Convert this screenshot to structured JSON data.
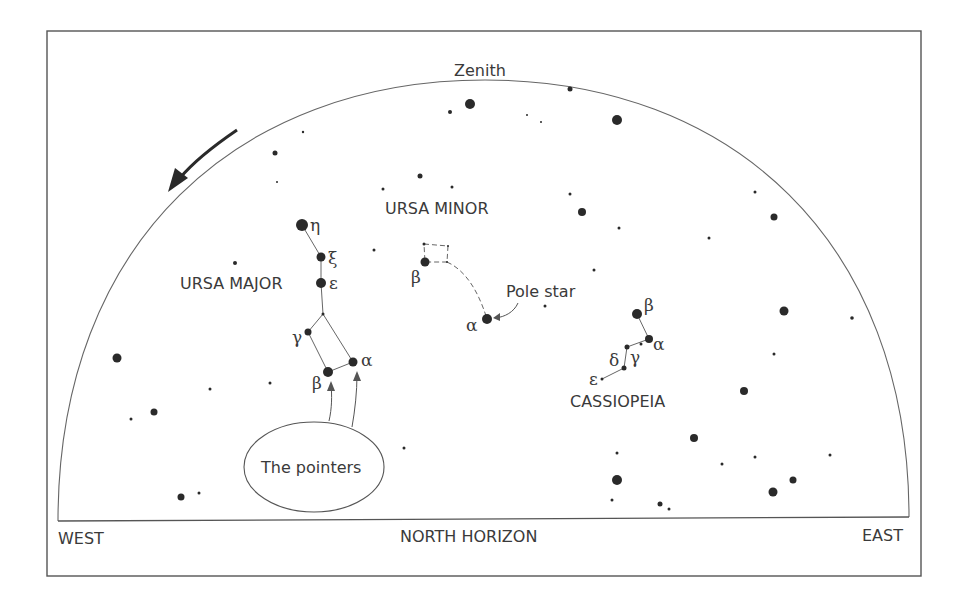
{
  "title_labels": {
    "zenith": "Zenith",
    "west": "WEST",
    "east": "EAST",
    "north_horizon": "NORTH HORIZON",
    "pole_star": "Pole star",
    "pointers": "The pointers"
  },
  "constellations": {
    "ursa_major": {
      "name": "URSA MAJOR",
      "stars": [
        {
          "greek": "η",
          "x": 302,
          "y": 225,
          "r": 6
        },
        {
          "greek": "ξ",
          "x": 321,
          "y": 257,
          "r": 4.5
        },
        {
          "greek": "ε",
          "x": 321,
          "y": 283,
          "r": 5
        },
        {
          "greek": "",
          "x": 323,
          "y": 314,
          "r": 1.5
        },
        {
          "greek": "γ",
          "x": 308,
          "y": 332,
          "r": 3.5
        },
        {
          "greek": "α",
          "x": 353,
          "y": 362,
          "r": 4.5
        },
        {
          "greek": "β",
          "x": 328,
          "y": 372,
          "r": 5
        }
      ]
    },
    "ursa_minor": {
      "name": "URSA MINOR",
      "stars": [
        {
          "greek": "β",
          "x": 425,
          "y": 262,
          "r": 4.5
        },
        {
          "greek": "",
          "x": 424,
          "y": 244,
          "r": 1.5
        },
        {
          "greek": "",
          "x": 448,
          "y": 246,
          "r": 1
        },
        {
          "greek": "",
          "x": 447,
          "y": 262,
          "r": 1
        },
        {
          "greek": "α",
          "x": 487,
          "y": 319,
          "r": 5
        }
      ]
    },
    "cassiopeia": {
      "name": "CASSIOPEIA",
      "stars": [
        {
          "greek": "β",
          "x": 637,
          "y": 314,
          "r": 5
        },
        {
          "greek": "α",
          "x": 649,
          "y": 339,
          "r": 4
        },
        {
          "greek": "",
          "x": 641,
          "y": 344,
          "r": 1.5
        },
        {
          "greek": "γ",
          "x": 627,
          "y": 347,
          "r": 2.5
        },
        {
          "greek": "δ",
          "x": 624,
          "y": 368,
          "r": 2.5
        },
        {
          "greek": "ε",
          "x": 602,
          "y": 379,
          "r": 1.5
        }
      ]
    }
  },
  "field_stars": [
    {
      "x": 470,
      "y": 104,
      "r": 5
    },
    {
      "x": 450,
      "y": 112,
      "r": 2
    },
    {
      "x": 570,
      "y": 89,
      "r": 2.5
    },
    {
      "x": 617,
      "y": 120,
      "r": 5
    },
    {
      "x": 303,
      "y": 132,
      "r": 1.2
    },
    {
      "x": 275,
      "y": 153,
      "r": 2.5
    },
    {
      "x": 420,
      "y": 176,
      "r": 2.5
    },
    {
      "x": 383,
      "y": 189,
      "r": 1.5
    },
    {
      "x": 452,
      "y": 187,
      "r": 1.5
    },
    {
      "x": 570,
      "y": 194,
      "r": 1.5
    },
    {
      "x": 582,
      "y": 212,
      "r": 4
    },
    {
      "x": 619,
      "y": 228,
      "r": 1.5
    },
    {
      "x": 709,
      "y": 238,
      "r": 1.5
    },
    {
      "x": 755,
      "y": 192,
      "r": 1.5
    },
    {
      "x": 774,
      "y": 217,
      "r": 3.5
    },
    {
      "x": 594,
      "y": 270,
      "r": 1.5
    },
    {
      "x": 545,
      "y": 306,
      "r": 1.5
    },
    {
      "x": 374,
      "y": 250,
      "r": 1.5
    },
    {
      "x": 235,
      "y": 263,
      "r": 2
    },
    {
      "x": 117,
      "y": 358,
      "r": 4.5
    },
    {
      "x": 210,
      "y": 389,
      "r": 1.5
    },
    {
      "x": 154,
      "y": 412,
      "r": 3.5
    },
    {
      "x": 131,
      "y": 419,
      "r": 1.5
    },
    {
      "x": 270,
      "y": 383,
      "r": 1.5
    },
    {
      "x": 181,
      "y": 497,
      "r": 3.5
    },
    {
      "x": 199,
      "y": 493,
      "r": 1.5
    },
    {
      "x": 784,
      "y": 311,
      "r": 4.5
    },
    {
      "x": 852,
      "y": 318,
      "r": 1.8
    },
    {
      "x": 774,
      "y": 354,
      "r": 1.5
    },
    {
      "x": 744,
      "y": 391,
      "r": 4
    },
    {
      "x": 694,
      "y": 438,
      "r": 4
    },
    {
      "x": 617,
      "y": 480,
      "r": 5
    },
    {
      "x": 617,
      "y": 453,
      "r": 1.5
    },
    {
      "x": 612,
      "y": 500,
      "r": 1.5
    },
    {
      "x": 660,
      "y": 504,
      "r": 2.5
    },
    {
      "x": 669,
      "y": 509,
      "r": 1.5
    },
    {
      "x": 722,
      "y": 464,
      "r": 1.5
    },
    {
      "x": 755,
      "y": 457,
      "r": 1.5
    },
    {
      "x": 793,
      "y": 480,
      "r": 3.5
    },
    {
      "x": 773,
      "y": 492,
      "r": 4.5
    },
    {
      "x": 830,
      "y": 455,
      "r": 1.5
    },
    {
      "x": 404,
      "y": 448,
      "r": 1.5
    },
    {
      "x": 277,
      "y": 182,
      "r": 1
    },
    {
      "x": 541,
      "y": 122,
      "r": 1
    },
    {
      "x": 527,
      "y": 115,
      "r": 1
    }
  ],
  "colors": {
    "ink": "#2a2a2a",
    "line": "#555555",
    "background": "#ffffff"
  }
}
